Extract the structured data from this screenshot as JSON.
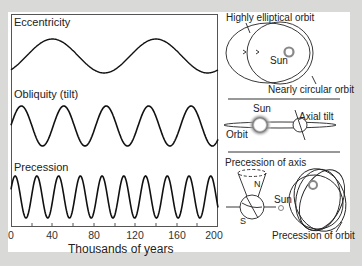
{
  "chart_data": {
    "type": "line",
    "title": "",
    "xlabel": "Thousands of years",
    "ylabel": "",
    "xlim": [
      0,
      200
    ],
    "x_ticks": [
      0,
      40,
      80,
      120,
      160,
      200
    ],
    "grid": false,
    "legend": "none",
    "series": [
      {
        "name": "Eccentricity",
        "period_kyr": 100,
        "cycles_shown": 2,
        "peaks_kyr": [
          40,
          140
        ],
        "shape": "sinusoid"
      },
      {
        "name": "Obliquity (tilt)",
        "period_kyr": 41,
        "cycles_shown": 5,
        "peaks_kyr": [
          10,
          51,
          92,
          133,
          174
        ],
        "shape": "sinusoid"
      },
      {
        "name": "Precession",
        "period_kyr": 21,
        "cycles_shown": 10,
        "peaks_kyr": [
          4,
          24,
          45,
          65,
          86,
          106,
          127,
          147,
          168,
          188
        ],
        "shape": "sinusoid"
      }
    ]
  },
  "panels": {
    "eccentricity": {
      "label": "Eccentricity",
      "diagram_labels": {
        "top": "Highly elliptical orbit",
        "center": "Sun",
        "bottom": "Nearly circular orbit"
      }
    },
    "obliquity": {
      "label": "Obliquity (tilt)",
      "diagram_labels": {
        "sun": "Sun",
        "tilt": "Axial tilt",
        "orbit": "Orbit"
      }
    },
    "precession": {
      "label": "Precession",
      "diagram_labels": {
        "axis": "Precession of axis",
        "north": "N",
        "south": "S",
        "sun": "Sun",
        "orbit": "Precession of orbit"
      }
    }
  },
  "axis": {
    "xlabel": "Thousands of years",
    "ticks": [
      "0",
      "40",
      "80",
      "120",
      "160",
      "200"
    ]
  },
  "colors": {
    "line": "#111111",
    "background": "#d9d9d7",
    "panel": "#ffffff"
  }
}
